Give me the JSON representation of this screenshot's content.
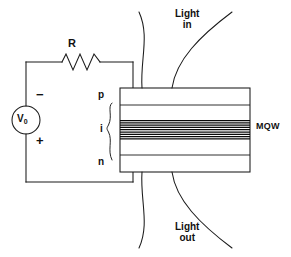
{
  "figure": {
    "width": 291,
    "height": 257,
    "background_color": "#ffffff",
    "line_color": "#1a1a1a"
  },
  "circuit": {
    "source": {
      "symbol": "voltage-source-circle",
      "label": "V",
      "label_subscript": "0",
      "terminal_top_sign": "−",
      "terminal_bottom_sign": "+",
      "center_x": 26,
      "center_y": 120,
      "radius": 14
    },
    "resistor": {
      "symbol": "resistor-zigzag",
      "label": "R",
      "peaks": 3
    },
    "wires": {
      "left_x": 26,
      "right_x": 133,
      "top_y": 62,
      "bottom_y": 182
    }
  },
  "device": {
    "name": "MQW",
    "mqw_label": "MQW",
    "box": {
      "x": 120,
      "y": 88,
      "width": 130,
      "height": 84
    },
    "region_labels": [
      {
        "key": "p",
        "label": "p",
        "y": 97
      },
      {
        "key": "i",
        "label": "i",
        "y": 130
      },
      {
        "key": "n",
        "label": "n",
        "y": 163
      }
    ],
    "brace": {
      "symbol": "curly-brace-right",
      "spans_label": "i",
      "top_y": 103,
      "bottom_y": 160
    },
    "layer_lines_y": [
      105,
      155
    ],
    "quantum_well_stripe": {
      "top_y": 120,
      "bottom_y": 139,
      "line_count": 9
    }
  },
  "light": {
    "in": {
      "line1": "Light",
      "line2": "in"
    },
    "out": {
      "line1": "Light",
      "line2": "out"
    },
    "beam_top": {
      "apex_left_x": 142,
      "apex_right_x": 172,
      "flare_left_x": 139,
      "flare_right_x": 232,
      "top_y": 12,
      "bottom_y": 88
    },
    "beam_bottom": {
      "apex_left_x": 142,
      "apex_right_x": 172,
      "flare_left_x": 139,
      "flare_right_x": 232,
      "top_y": 172,
      "bottom_y": 248
    }
  }
}
